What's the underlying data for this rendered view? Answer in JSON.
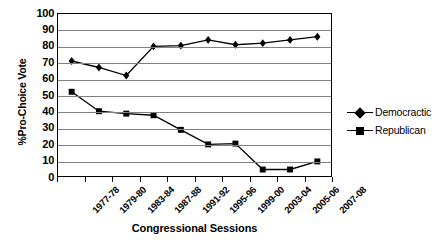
{
  "chart_data": {
    "type": "line",
    "title": "",
    "xlabel": "Congressional Sessions",
    "ylabel": "%Pro-Choice Vote",
    "ylim": [
      0,
      100
    ],
    "ytick_step": 10,
    "yticks": [
      100,
      90,
      80,
      70,
      60,
      50,
      40,
      30,
      20,
      10,
      0
    ],
    "grid": true,
    "grid_axis": "y",
    "legend_position": "right",
    "categories": [
      "1977-78",
      "1979-80",
      "1983-84",
      "1987-88",
      "1991-92",
      "1995-96",
      "1999-00",
      "2003-04",
      "2005-06",
      "2007-08"
    ],
    "series": [
      {
        "name": "Democractic",
        "marker": "diamond",
        "color": "#000000",
        "values": [
          71,
          67,
          62,
          80,
          80.5,
          84,
          81,
          82,
          84,
          86
        ]
      },
      {
        "name": "Republican",
        "marker": "square",
        "color": "#000000",
        "values": [
          52,
          40,
          38.5,
          37.5,
          28.5,
          19.5,
          20,
          4,
          4,
          9
        ]
      }
    ]
  },
  "legend": {
    "items": [
      {
        "label": "Democractic",
        "marker": "diamond"
      },
      {
        "label": "Republican",
        "marker": "square"
      }
    ]
  }
}
